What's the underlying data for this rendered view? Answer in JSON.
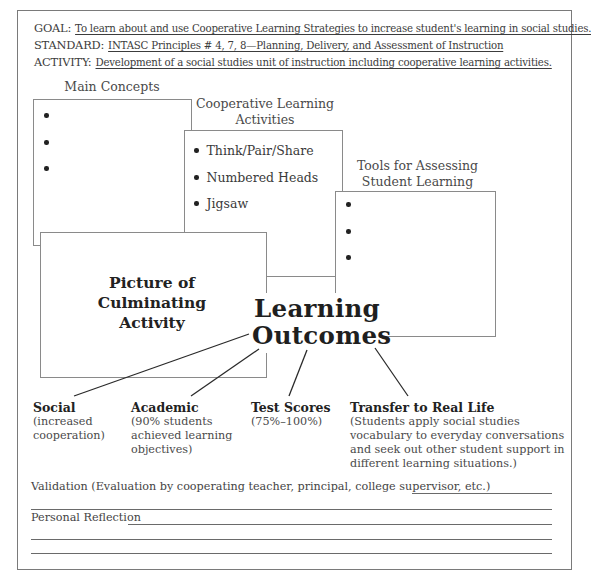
{
  "header": {
    "goal": {
      "label": "GOAL:",
      "value": "To learn about and use Cooperative Learning Strategies to increase student's learning in social studies."
    },
    "standard": {
      "label": "STANDARD:",
      "value": "INTASC Principles # 4, 7, 8—Planning, Delivery, and Assessment of Instruction"
    },
    "activity": {
      "label": "ACTIVITY:",
      "value": "Development of a social studies unit of instruction including cooperative learning activities."
    }
  },
  "boxes": {
    "main_concepts": {
      "title": "Main Concepts",
      "bullets": [
        "",
        "",
        ""
      ]
    },
    "cooperative": {
      "title_line1": "Cooperative Learning",
      "title_line2": "Activities",
      "bullets": [
        "Think/Pair/Share",
        "Numbered Heads",
        "Jigsaw"
      ]
    },
    "tools": {
      "title_line1": "Tools for Assessing",
      "title_line2": "Student Learning",
      "bullets": [
        "",
        "",
        ""
      ]
    },
    "picture": {
      "line1": "Picture of",
      "line2": "Culminating",
      "line3": "Activity"
    }
  },
  "center": {
    "line1": "Learning",
    "line2": "Outcomes"
  },
  "outcomes": [
    {
      "title": "Social",
      "desc": [
        "(increased",
        "cooperation)"
      ]
    },
    {
      "title": "Academic",
      "desc": [
        "(90% students",
        "achieved learning",
        "objectives)"
      ]
    },
    {
      "title": "Test Scores",
      "desc": [
        "(75%–100%)"
      ]
    },
    {
      "title": "Transfer to Real Life",
      "desc": [
        "(Students apply social studies",
        "vocabulary to everyday conversations",
        "and seek out other student support in",
        "different learning situations.)"
      ]
    }
  ],
  "footer": {
    "validation": "Validation (Evaluation by cooperating teacher, principal, college supervisor, etc.)",
    "reflection": "Personal Reflection"
  },
  "colors": {
    "border": "#8a8a8a",
    "text": "#3a3a3a",
    "heading": "#1f1f1f"
  }
}
